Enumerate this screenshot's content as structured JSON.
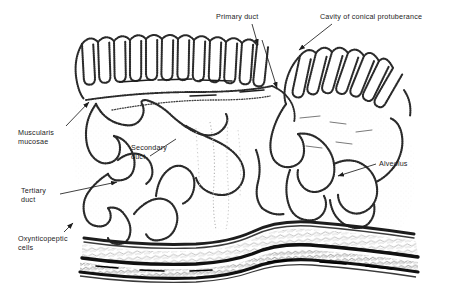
{
  "figure": {
    "domain": "biological-histology-diagram",
    "ink_color": "#1d1d1d",
    "background_color": "#ffffff",
    "width": 450,
    "height": 292
  },
  "labels": [
    {
      "id": "primary-duct",
      "text": "Primary duct",
      "x": 216,
      "y": 12,
      "align": "left"
    },
    {
      "id": "cavity-of-conical-protuberance",
      "text": "Cavity of conical protuberance",
      "x": 320,
      "y": 12,
      "align": "left"
    },
    {
      "id": "muscularis-mucosae",
      "text": "Muscularis\nmucosae",
      "x": 18,
      "y": 128,
      "align": "left"
    },
    {
      "id": "secondary-duct",
      "text": "Secondary\nduct",
      "x": 131,
      "y": 143,
      "align": "left"
    },
    {
      "id": "alveolus",
      "text": "Alveolus",
      "x": 379,
      "y": 159,
      "align": "left"
    },
    {
      "id": "tertiary-duct",
      "text": "Tertiary\nduct",
      "x": 21,
      "y": 186,
      "align": "left"
    },
    {
      "id": "oxynticopeptic-cells",
      "text": "Oxynticopeptic\ncells",
      "x": 18,
      "y": 234,
      "align": "left"
    }
  ],
  "leaders": [
    {
      "id": "leader-primary-duct",
      "from": [
        252,
        24
      ],
      "to": [
        258,
        47
      ],
      "arrow": true
    },
    {
      "id": "leader-primary-duct-2",
      "from": [
        262,
        36
      ],
      "to": [
        276,
        90
      ],
      "arrow": true
    },
    {
      "id": "leader-cavity",
      "from": [
        330,
        24
      ],
      "to": [
        297,
        52
      ],
      "arrow": true
    },
    {
      "id": "leader-muscularis",
      "from": [
        66,
        126
      ],
      "to": [
        90,
        101
      ],
      "arrow": true
    },
    {
      "id": "leader-secondary-duct",
      "from": [
        150,
        156
      ],
      "to": [
        176,
        138
      ],
      "arrow": false
    },
    {
      "id": "leader-alveolus",
      "from": [
        376,
        164
      ],
      "to": [
        336,
        176
      ],
      "arrow": true
    },
    {
      "id": "leader-tertiary-duct",
      "from": [
        60,
        194
      ],
      "to": [
        118,
        182
      ],
      "arrow": true
    },
    {
      "id": "leader-oxynticopeptic",
      "from": [
        62,
        232
      ],
      "to": [
        72,
        222
      ],
      "arrow": true
    }
  ],
  "structures": [
    {
      "id": "apical-tubule-row-left",
      "name": "Crypt tubules of left lobe"
    },
    {
      "id": "apical-tubule-row-right",
      "name": "Crypt tubules of right lobe"
    },
    {
      "id": "secondary-duct-lumen",
      "name": "Secondary duct lumen"
    },
    {
      "id": "tertiary-duct-lumen",
      "name": "Tertiary duct lumen"
    },
    {
      "id": "alveolar-sacs",
      "name": "Alveolar sacs"
    },
    {
      "id": "muscularis-mucosae-band",
      "name": "Muscularis mucosae band"
    },
    {
      "id": "submucosa-layer",
      "name": "Submucosa"
    },
    {
      "id": "muscular-layer",
      "name": "Outer muscular layer"
    }
  ]
}
